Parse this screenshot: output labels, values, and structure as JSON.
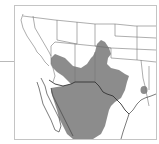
{
  "map": {
    "subject": "species range map",
    "region": "Southwestern United States and Mexico",
    "range_color": "#8c8c8c",
    "boundary_color": "#555555",
    "border_color": "#333333",
    "background_color": "#ffffff",
    "range_areas": [
      "southeastern Arizona",
      "southern New Mexico",
      "southeastern Colorado",
      "western and central Texas",
      "northern Mexico",
      "east Texas (isolated patch)"
    ]
  }
}
